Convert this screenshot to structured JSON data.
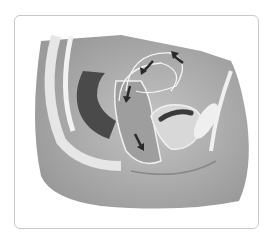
{
  "image": {
    "description": "Grayscale medical illustration: sagittal cross-section of female pelvis with arrows indicating movement around pelvic organs",
    "colors": {
      "frame_border": "#c8c8c8",
      "background": "#ffffff",
      "body_fill": "#b8b8b8",
      "organ_dark": "#4a4a4a",
      "arrow": "#2a2a2a"
    }
  }
}
